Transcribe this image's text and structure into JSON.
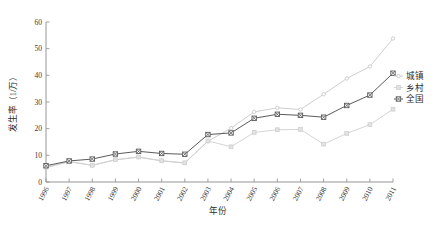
{
  "chart_data": {
    "type": "line",
    "title": "",
    "xlabel": "年份",
    "ylabel": "发生率（1/万）",
    "categories": [
      "1996",
      "1997",
      "1998",
      "1999",
      "2000",
      "2001",
      "2002",
      "2003",
      "2004",
      "2005",
      "2006",
      "2007",
      "2008",
      "2009",
      "2010",
      "2011"
    ],
    "x": [
      1996,
      1997,
      1998,
      1999,
      2000,
      2001,
      2002,
      2003,
      2004,
      2005,
      2006,
      2007,
      2008,
      2009,
      2010,
      2011
    ],
    "xlim": [
      1996,
      2011
    ],
    "ylim": [
      0,
      60
    ],
    "yticks": [
      0,
      10,
      20,
      30,
      40,
      50,
      60
    ],
    "ytick_labels": [
      "0",
      "10",
      "20",
      "30",
      "40",
      "50",
      "60"
    ],
    "grid": false,
    "legend_position": "right",
    "series": [
      {
        "name": "城镇",
        "color": "#c8c8c8",
        "marker": "dot",
        "values": [
          5.3,
          7.6,
          6.2,
          8.3,
          9.3,
          7.9,
          7.1,
          15.3,
          20.2,
          26.3,
          27.8,
          27.2,
          32.9,
          38.8,
          43.3,
          53.8
        ]
      },
      {
        "name": "乡村",
        "color": "#d0d0d0",
        "marker": "square",
        "values": [
          5.6,
          7.7,
          6.3,
          8.4,
          9.4,
          8.0,
          7.2,
          15.4,
          13.2,
          18.6,
          19.6,
          19.7,
          14.2,
          18.2,
          21.5,
          27.3
        ]
      },
      {
        "name": "全国",
        "color": "#5a5a5a",
        "marker": "cross-square",
        "values": [
          6.1,
          7.9,
          8.6,
          10.5,
          11.5,
          10.7,
          10.4,
          17.8,
          18.4,
          23.9,
          25.4,
          25.0,
          24.3,
          28.7,
          32.6,
          40.8
        ]
      }
    ]
  },
  "legend": {
    "items": [
      {
        "label": "城镇"
      },
      {
        "label": "乡村"
      },
      {
        "label": "全国"
      }
    ]
  },
  "axes": {
    "x_title": "年份",
    "y_title": "发生率（1/万）"
  }
}
